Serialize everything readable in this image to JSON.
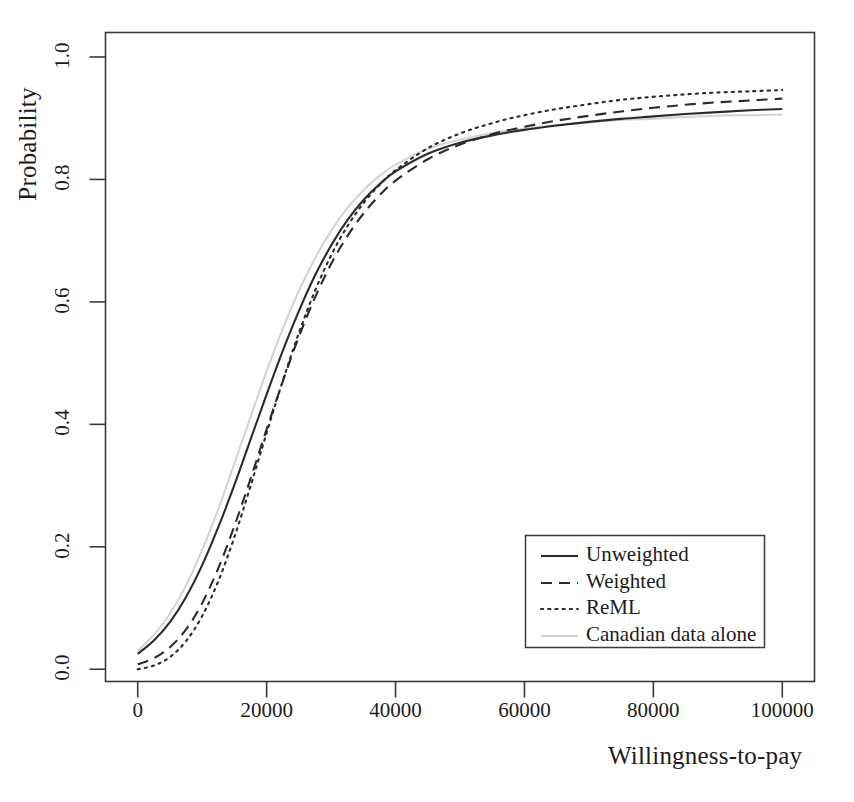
{
  "chart_data": {
    "type": "line",
    "title": "",
    "subtitle": "",
    "xlabel": "Willingness-to-pay",
    "ylabel": "Probability",
    "xlim": [
      -5000,
      105000
    ],
    "ylim": [
      -0.02,
      1.04
    ],
    "xticks": [
      0,
      20000,
      40000,
      60000,
      80000,
      100000
    ],
    "xticklabels": [
      "0",
      "20000",
      "40000",
      "60000",
      "80000",
      "100000"
    ],
    "yticks": [
      0.0,
      0.2,
      0.4,
      0.6,
      0.8,
      1.0
    ],
    "yticklabels": [
      "0.0",
      "0.2",
      "0.4",
      "0.6",
      "0.8",
      "1.0"
    ],
    "grid": false,
    "legend_position": "lower right",
    "x": [
      0,
      2500,
      5000,
      7500,
      10000,
      12500,
      15000,
      17500,
      20000,
      22500,
      25000,
      27500,
      30000,
      32500,
      35000,
      37500,
      40000,
      45000,
      50000,
      55000,
      60000,
      65000,
      70000,
      75000,
      80000,
      85000,
      90000,
      95000,
      100000
    ],
    "series": [
      {
        "name": "Unweighted",
        "style": "solid",
        "color": "#2b2b2b",
        "values": [
          0.025,
          0.047,
          0.077,
          0.118,
          0.17,
          0.232,
          0.301,
          0.375,
          0.449,
          0.52,
          0.585,
          0.643,
          0.692,
          0.733,
          0.766,
          0.792,
          0.813,
          0.842,
          0.86,
          0.872,
          0.881,
          0.888,
          0.894,
          0.899,
          0.903,
          0.907,
          0.91,
          0.913,
          0.915
        ]
      },
      {
        "name": "Weighted",
        "style": "dashed",
        "color": "#2b2b2b",
        "values": [
          0.008,
          0.018,
          0.036,
          0.065,
          0.108,
          0.165,
          0.234,
          0.311,
          0.392,
          0.47,
          0.543,
          0.607,
          0.662,
          0.707,
          0.744,
          0.774,
          0.798,
          0.833,
          0.857,
          0.874,
          0.886,
          0.896,
          0.904,
          0.911,
          0.917,
          0.922,
          0.926,
          0.929,
          0.932
        ]
      },
      {
        "name": "ReML",
        "style": "dotted",
        "color": "#2b2b2b",
        "values": [
          0.0,
          0.006,
          0.02,
          0.046,
          0.087,
          0.144,
          0.216,
          0.299,
          0.386,
          0.471,
          0.549,
          0.618,
          0.676,
          0.723,
          0.761,
          0.791,
          0.815,
          0.851,
          0.875,
          0.892,
          0.905,
          0.915,
          0.923,
          0.93,
          0.935,
          0.939,
          0.942,
          0.944,
          0.946
        ]
      },
      {
        "name": "Canadian data alone",
        "style": "solid",
        "color": "#d2d2d2",
        "values": [
          0.03,
          0.056,
          0.091,
          0.137,
          0.195,
          0.262,
          0.336,
          0.412,
          0.487,
          0.556,
          0.618,
          0.671,
          0.716,
          0.753,
          0.782,
          0.806,
          0.824,
          0.85,
          0.865,
          0.876,
          0.883,
          0.889,
          0.893,
          0.897,
          0.899,
          0.902,
          0.904,
          0.905,
          0.906
        ]
      }
    ]
  },
  "legend": {
    "entries": [
      {
        "label": "Unweighted"
      },
      {
        "label": "Weighted"
      },
      {
        "label": "ReML"
      },
      {
        "label": "Canadian data alone"
      }
    ]
  },
  "axes": {
    "frame_color": "#3a3a3a"
  }
}
